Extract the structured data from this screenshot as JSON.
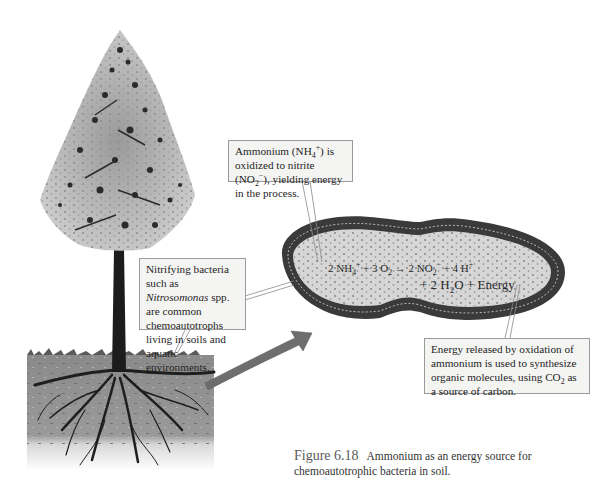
{
  "figure": {
    "number": "Figure 6.18",
    "caption": "Ammonium as an energy source for chemoautotrophic bacteria in soil."
  },
  "callouts": {
    "ammonium": {
      "pre": "Ammonium (NH",
      "sub1": "4",
      "sup1": "+",
      "mid": ") is oxidized to nitrite (NO",
      "sub2": "2",
      "sup2": "−",
      "post": "), yielding energy in the process."
    },
    "nitrifying": {
      "pre": "Nitrifying bacteria such as ",
      "italic": "Nitrosomonas",
      "post": " spp. are common chemoautotrophs living in soils and aquatic environments."
    },
    "energy": {
      "pre": "Energy released by oxidation of ammonium is used to synthesize organic molecules, using CO",
      "sub": "2",
      "post": " as a source of carbon."
    }
  },
  "equation": {
    "line1": {
      "a": "2 NH",
      "a_sub": "4",
      "a_sup": "+",
      "b": " + 3 O",
      "b_sub": "2",
      "arrow": " → ",
      "c": "2 NO",
      "c_sub": "2",
      "c_sup": "−",
      "d": " + 4 H",
      "d_sup": "+"
    },
    "line2": {
      "a": "+ 2 H",
      "a_sub": "2",
      "b": "O + Energy"
    }
  },
  "colors": {
    "soil": "#8c8c8c",
    "soil_light": "#d9d9d9",
    "bark": "#1c1c1c",
    "foliage": "#a8a8a8",
    "cell_wall": "#3a3a3a",
    "cytoplasm": "#d6d6d6",
    "arrow": "#6e6e6e",
    "callout_bg": "#f4f4f2",
    "callout_border": "#9a9a9a"
  }
}
